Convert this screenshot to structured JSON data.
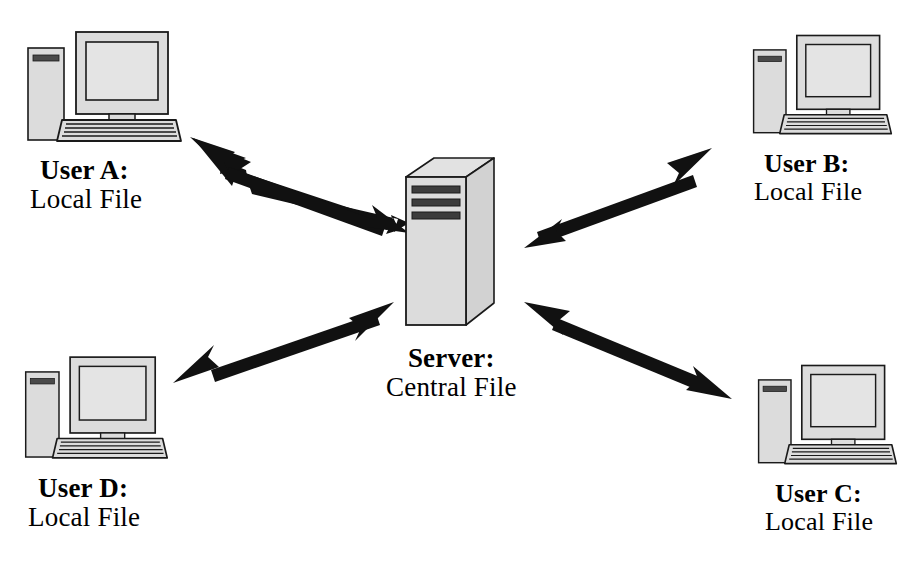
{
  "diagram": {
    "type": "network-topology",
    "background_color": "#ffffff",
    "stroke_color": "#000000",
    "fill_color": "#d9d9d9",
    "arrow_color": "#111111"
  },
  "nodes": [
    {
      "id": "user-a",
      "icon": "desktop-computer-icon",
      "title": "User A:",
      "subtitle": "Local File",
      "position": "top-left"
    },
    {
      "id": "user-b",
      "icon": "desktop-computer-icon",
      "title": "User B:",
      "subtitle": "Local File",
      "position": "top-right"
    },
    {
      "id": "user-c",
      "icon": "desktop-computer-icon",
      "title": "User C:",
      "subtitle": "Local File",
      "position": "bottom-right"
    },
    {
      "id": "user-d",
      "icon": "desktop-computer-icon",
      "title": "User D:",
      "subtitle": "Local File",
      "position": "bottom-left"
    },
    {
      "id": "server",
      "icon": "server-tower-icon",
      "title": "Server:",
      "subtitle": "Central File",
      "position": "center",
      "slots": 3
    }
  ],
  "connections": [
    {
      "id": "conn-a",
      "from": "user-a",
      "to": "server",
      "style": "double-headed-arrow"
    },
    {
      "id": "conn-b",
      "from": "user-b",
      "to": "server",
      "style": "double-headed-arrow"
    },
    {
      "id": "conn-c",
      "from": "user-c",
      "to": "server",
      "style": "double-headed-arrow"
    },
    {
      "id": "conn-d",
      "from": "user-d",
      "to": "server",
      "style": "double-headed-arrow"
    }
  ]
}
